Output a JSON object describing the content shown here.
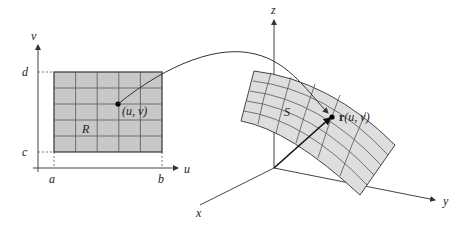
{
  "figure": {
    "type": "parametric surface mapping diagram",
    "colors": {
      "background": "#ffffff",
      "region_fill": "#c8c8c8",
      "surface_fill": "#dedede",
      "grid_lines": "#555555",
      "axes": "#444444",
      "curve": "#333333",
      "point": "#000000"
    }
  },
  "left_plane": {
    "axis_labels": {
      "horizontal": "u",
      "vertical": "v"
    },
    "tick_labels": {
      "u_min": "a",
      "u_max": "b",
      "v_min": "c",
      "v_max": "d"
    },
    "region_label": "R",
    "point_label": "(u, v)",
    "grid": {
      "columns": 5,
      "rows": 5
    }
  },
  "right_space": {
    "axis_labels": {
      "x": "x",
      "y": "y",
      "z": "z"
    },
    "surface_label": "S",
    "point_label_bold": "r",
    "point_label_rest": "(u, v)",
    "grid": {
      "u_lines": 6,
      "v_lines": 6
    }
  },
  "mapping_arrow": {
    "from": "(u, v)",
    "to": "r(u, v)"
  }
}
